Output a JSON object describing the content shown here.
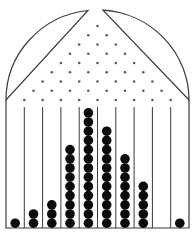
{
  "diagram": {
    "type": "galton-board",
    "title": "",
    "colors": {
      "background": "#ffffff",
      "line": "#3a3a3a",
      "peg": "#5a5a5a",
      "ball": "#0a0a0a"
    },
    "geometry": {
      "left_wall_x": 6,
      "right_wall_x": 189,
      "floor_y": 228,
      "dome_base_y": 100,
      "dome_top_y": 14,
      "funnel_left_top_x": 88,
      "funnel_right_top_x": 103,
      "divider_top_y": 107,
      "ball_diameter": 9.6
    },
    "peg_rows": [
      1,
      2,
      3,
      4,
      5,
      6,
      7,
      8,
      9
    ],
    "bins": [
      {
        "index": 1,
        "count": 1
      },
      {
        "index": 2,
        "count": 2
      },
      {
        "index": 3,
        "count": 3
      },
      {
        "index": 4,
        "count": 9
      },
      {
        "index": 5,
        "count": 13
      },
      {
        "index": 6,
        "count": 11
      },
      {
        "index": 7,
        "count": 8
      },
      {
        "index": 8,
        "count": 5
      },
      {
        "index": 9,
        "count": 0
      },
      {
        "index": 10,
        "count": 1
      }
    ]
  }
}
